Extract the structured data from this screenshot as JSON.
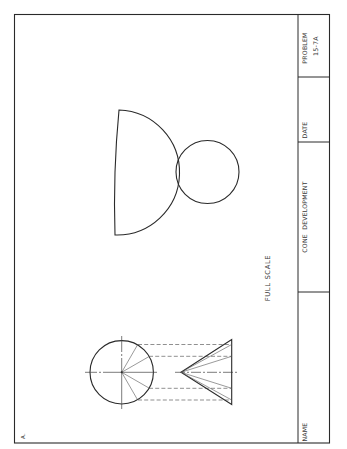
{
  "drawing": {
    "part_label": "A.",
    "scale_note": "FULL SCALE",
    "colors": {
      "line": "#2a2a2a",
      "thin_line": "#555555",
      "background": "#ffffff"
    }
  },
  "title_block": {
    "name_label": "NAME",
    "title": "CONE  DEVELOPMENT",
    "date_label": "DATE",
    "problem_label": "PROBLEM",
    "problem_number": "15-7A"
  },
  "figures": {
    "development": {
      "type": "sector",
      "description": "flat pattern of cone surface"
    },
    "base_circle": {
      "type": "circle",
      "description": "cone base for development"
    },
    "top_view": {
      "type": "circle-with-radial-elements",
      "radial_angles_deg": [
        -60,
        -30,
        0,
        30,
        60
      ]
    },
    "front_view": {
      "type": "cone-profile-with-elements"
    }
  }
}
